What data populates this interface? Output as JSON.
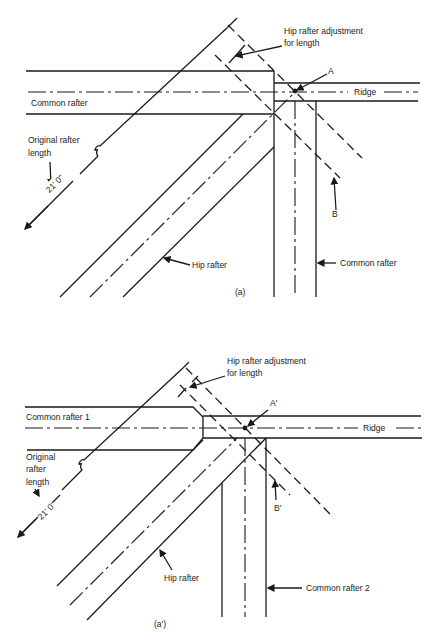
{
  "figure_a": {
    "caption": "(a)",
    "labels": {
      "adjustment_line1": "Hip rafter adjustment",
      "adjustment_line2": "for length",
      "point_a": "A",
      "ridge": "Ridge",
      "common_rafter_left": "Common rafter",
      "original_line1": "Original rafter",
      "original_line2": "length",
      "dimension": "21' 0\"",
      "point_b": "B",
      "hip_rafter": "Hip rafter",
      "common_rafter_right": "Common rafter"
    }
  },
  "figure_b": {
    "caption": "(a')",
    "labels": {
      "adjustment_line1": "Hip rafter adjustment",
      "adjustment_line2": "for length",
      "point_a": "A'",
      "ridge": "Ridge",
      "common_rafter_1": "Common rafter 1",
      "original_line1": "Original",
      "original_line2": "rafter",
      "original_line3": "length",
      "dimension": "21' 0\"",
      "point_b": "B'",
      "hip_rafter": "Hip rafter",
      "common_rafter_2": "Common rafter 2"
    }
  }
}
